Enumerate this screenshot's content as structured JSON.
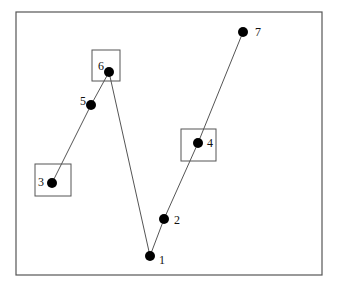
{
  "diagram": {
    "title": "",
    "frame": {
      "x": 16,
      "y": 12,
      "width": 306,
      "height": 263,
      "stroke": "#555555"
    },
    "point_color": "#000000",
    "line_color": "#555555",
    "box_color": "#555555",
    "points": [
      {
        "id": "1",
        "label": "1",
        "x": 150,
        "y": 256,
        "lx": 159,
        "ly": 264,
        "boxed": false
      },
      {
        "id": "2",
        "label": "2",
        "x": 164,
        "y": 219,
        "lx": 174,
        "ly": 224,
        "boxed": false
      },
      {
        "id": "3",
        "label": "3",
        "x": 52,
        "y": 183,
        "lx": 38,
        "ly": 186,
        "boxed": true,
        "box": {
          "x": 35,
          "y": 164,
          "w": 36,
          "h": 32
        }
      },
      {
        "id": "4",
        "label": "4",
        "x": 198,
        "y": 143,
        "lx": 207,
        "ly": 147,
        "boxed": true,
        "box": {
          "x": 181,
          "y": 129,
          "w": 35,
          "h": 32
        }
      },
      {
        "id": "5",
        "label": "5",
        "x": 91,
        "y": 105,
        "lx": 80,
        "ly": 105,
        "boxed": false
      },
      {
        "id": "6",
        "label": "6",
        "x": 109,
        "y": 72,
        "lx": 98,
        "ly": 70,
        "boxed": true,
        "box": {
          "x": 92,
          "y": 50,
          "w": 28,
          "h": 31
        }
      },
      {
        "id": "7",
        "label": "7",
        "x": 243,
        "y": 32,
        "lx": 255,
        "ly": 36,
        "boxed": false
      }
    ],
    "path_order": [
      "3",
      "5",
      "6",
      "1",
      "2",
      "4",
      "7"
    ]
  }
}
